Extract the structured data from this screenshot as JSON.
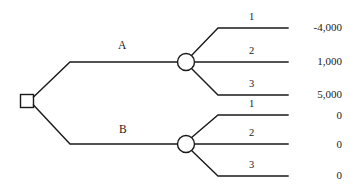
{
  "diagram": {
    "type": "decision-tree",
    "title": "",
    "stroke_color": "#1a1a1a",
    "background": "#ffffff",
    "decision_node": {
      "shape": "square",
      "label": ""
    },
    "options": [
      {
        "id": "A",
        "label": "A",
        "chance_node_shape": "circle",
        "outcomes": [
          {
            "label": "1",
            "payoff": "-4,000"
          },
          {
            "label": "2",
            "payoff": "1,000"
          },
          {
            "label": "3",
            "payoff": "5,000"
          }
        ]
      },
      {
        "id": "B",
        "label": "B",
        "chance_node_shape": "circle",
        "outcomes": [
          {
            "label": "1",
            "payoff": "0"
          },
          {
            "label": "2",
            "payoff": "0"
          },
          {
            "label": "3",
            "payoff": "0"
          }
        ]
      }
    ]
  }
}
